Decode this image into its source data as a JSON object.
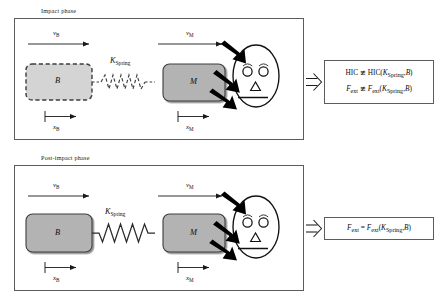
{
  "figure": {
    "title_top": "Impact phase",
    "title_bottom": "Post-impact phase"
  },
  "panels": [
    {
      "id": "impact",
      "label": "Impact phase",
      "blocks": [
        {
          "name": "B",
          "label": "B",
          "border": "dashed",
          "fill": "#d4d4d4"
        },
        {
          "name": "M",
          "label": "M",
          "border": "solid",
          "fill": "#b3b3b3"
        }
      ],
      "spring": {
        "label_k": "K",
        "label_sub": "Spring",
        "style": "dashed"
      },
      "velocity_arrows": [
        {
          "name": "v_B",
          "symbol": "v",
          "sub": "B"
        },
        {
          "name": "v_M",
          "symbol": "v",
          "sub": "M"
        }
      ],
      "displacement_markers": [
        {
          "name": "x_B",
          "symbol": "x",
          "sub": "B"
        },
        {
          "name": "x_M",
          "symbol": "x",
          "sub": "M"
        }
      ],
      "head": {
        "eyes": 2,
        "nose": "triangle",
        "mouth": "line",
        "impact_arrows": 2
      },
      "connector": "double-arrow-right",
      "results": [
        "HIC ≇ HIC(KₛSpring, B)",
        "Fₑₓₜ ≇ Fₑₓₜ(KₛSpring, B)"
      ],
      "result_lines": [
        {
          "lhs": "HIC",
          "rel": "≇",
          "rhs_fn": "HIC",
          "rhs_args": "K",
          "rhs_args_sub": "Spring",
          "rhs_args_2": "B"
        },
        {
          "lhs": "F",
          "lhs_sub": "ext",
          "rel": "≇",
          "rhs_fn": "F",
          "rhs_fn_sub": "ext",
          "rhs_args": "K",
          "rhs_args_sub": "Spring",
          "rhs_args_2": "B"
        }
      ]
    },
    {
      "id": "post-impact",
      "label": "Post-impact phase",
      "blocks": [
        {
          "name": "B",
          "label": "B",
          "border": "solid",
          "fill": "#b3b3b3"
        },
        {
          "name": "M",
          "label": "M",
          "border": "solid",
          "fill": "#b3b3b3"
        }
      ],
      "spring": {
        "label_k": "K",
        "label_sub": "Spring",
        "style": "solid"
      },
      "velocity_arrows": [
        {
          "name": "v_B",
          "symbol": "v",
          "sub": "B"
        },
        {
          "name": "v_M",
          "symbol": "v",
          "sub": "M"
        }
      ],
      "displacement_markers": [
        {
          "name": "x_B",
          "symbol": "x",
          "sub": "B"
        },
        {
          "name": "x_M",
          "symbol": "x",
          "sub": "M"
        }
      ],
      "head": {
        "eyes": 2,
        "nose": "triangle",
        "mouth": "line",
        "impact_arrows": 2
      },
      "connector": "double-arrow-right",
      "results": [
        "Fₑₓₜ = Fₑₓₜ(KₛSpring, B)"
      ],
      "result_lines": [
        {
          "lhs": "F",
          "lhs_sub": "ext",
          "rel": "=",
          "rhs_fn": "F",
          "rhs_fn_sub": "ext",
          "rhs_args": "K",
          "rhs_args_sub": "Spring",
          "rhs_args_2": "B"
        }
      ]
    }
  ],
  "symbols": {
    "v": "v",
    "x": "x",
    "K": "K",
    "spring_sub": "Spring",
    "B": "B",
    "M": "M",
    "HIC": "HIC",
    "F": "F",
    "ext_sub": "ext",
    "not_congruent": "≇",
    "equals": "=",
    "comma": ","
  },
  "colors": {
    "block_fill_active": "#b3b3b3",
    "block_fill_inactive": "#d4d4d4",
    "border": "#5c5c5c",
    "line": "#1a1a1a",
    "impact_arrow": "#000000",
    "background": "#ffffff"
  }
}
